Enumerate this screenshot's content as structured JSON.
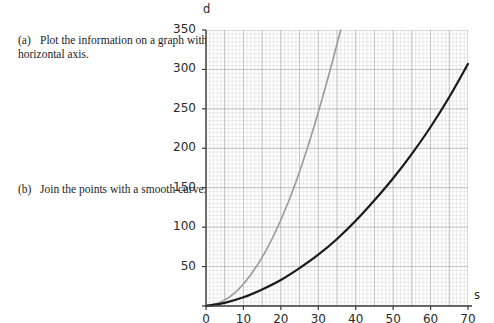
{
  "questions": [
    {
      "id": "a",
      "label": "(a)",
      "text_parts": [
        {
          "t": "Plot the information on a graph with distance (",
          "i": false
        },
        {
          "t": "d",
          "i": true
        },
        {
          "t": ") on the vertical axis and speed (",
          "i": false
        },
        {
          "t": "s",
          "i": true
        },
        {
          "t": ") on the horizontal axis.",
          "i": false
        }
      ]
    },
    {
      "id": "b",
      "label": "(b)",
      "text_parts": [
        {
          "t": "Join the points with a smooth curve. This is the black curve.",
          "i": false
        }
      ]
    }
  ],
  "chart_data": {
    "type": "line",
    "title": "",
    "xlabel": "s",
    "ylabel": "d",
    "xlim": [
      0,
      70
    ],
    "ylim": [
      0,
      350
    ],
    "grid": true,
    "grid_minor_step_x": 1,
    "grid_minor_step_y": 5,
    "grid_major_step_x": 5,
    "grid_major_step_y": 50,
    "legend": "none",
    "xticks": [
      0,
      10,
      20,
      30,
      40,
      50,
      60,
      70
    ],
    "yticks": [
      0,
      50,
      100,
      150,
      200,
      250,
      300,
      350
    ],
    "colors": {
      "black_curve": "#1a1a1a",
      "grey_curve": "#9a9a9a",
      "grid_minor": "#d8d8d8",
      "grid_major": "#9c9c9c",
      "axis": "#3a3a3a"
    },
    "series": [
      {
        "name": "black curve",
        "color": "#1a1a1a",
        "width": 2.2,
        "comment": "smooth curve through the plotted points",
        "x": [
          0,
          5,
          10,
          15,
          20,
          25,
          30,
          35,
          40,
          45,
          50,
          55,
          60,
          65,
          70
        ],
        "y": [
          0,
          4,
          11,
          21,
          33,
          48,
          65,
          85,
          108,
          134,
          162,
          193,
          227,
          265,
          307
        ]
      },
      {
        "name": "grey curve",
        "color": "#9a9a9a",
        "width": 1.6,
        "comment": "steeper reference curve reaching 350 near s = 36",
        "x": [
          0,
          4,
          8,
          12,
          16,
          20,
          24,
          28,
          32,
          36
        ],
        "y": [
          0,
          5,
          18,
          40,
          70,
          109,
          157,
          214,
          279,
          350
        ]
      }
    ]
  }
}
